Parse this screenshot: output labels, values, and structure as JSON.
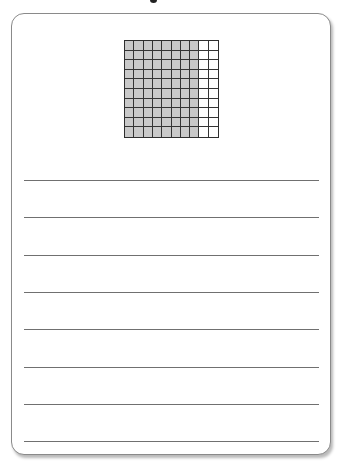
{
  "worksheet": {
    "title_fragment_visible": true,
    "grid": {
      "rows": 10,
      "columns": 10,
      "total_squares": 100,
      "shaded_columns": 8,
      "shaded_squares": 80,
      "unshaded_squares": 20,
      "shaded_color": "#c9c9c9",
      "unshaded_color": "#ffffff",
      "border_color": "#333333"
    },
    "answer_lines": {
      "count": 8,
      "color": "#707070"
    },
    "card": {
      "border_color": "#8a8a8a",
      "background": "#ffffff"
    }
  }
}
